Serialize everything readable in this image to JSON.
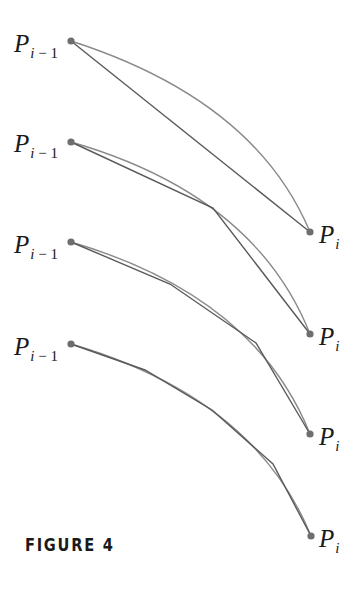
{
  "caption": "FIGURE 4",
  "colors": {
    "curve": "#8a8a8a",
    "polygon": "#5a5a5a",
    "point": "#6e6e6e",
    "text": "#1a1a1a"
  },
  "labels": {
    "start": {
      "base": "P",
      "sub_var": "i",
      "sub_rest": " − 1"
    },
    "end": {
      "base": "P",
      "sub_var": "i"
    }
  },
  "panels": [
    {
      "start_label_pos": [
        14,
        31
      ],
      "end_label_pos": [
        319,
        222
      ],
      "curve": "M71,41 Q255,100 310,232",
      "polygon": [
        [
          71,
          41
        ],
        [
          310,
          232
        ]
      ]
    },
    {
      "start_label_pos": [
        14,
        131
      ],
      "end_label_pos": [
        319,
        324
      ],
      "curve": "M71,142 Q255,195 310,334",
      "polygon": [
        [
          71,
          142
        ],
        [
          213,
          208
        ],
        [
          310,
          334
        ]
      ]
    },
    {
      "start_label_pos": [
        14,
        232
      ],
      "end_label_pos": [
        319,
        424
      ],
      "curve": "M71,242 Q255,296 310,434",
      "polygon": [
        [
          71,
          242
        ],
        [
          170,
          284
        ],
        [
          256,
          343
        ],
        [
          310,
          434
        ]
      ]
    },
    {
      "start_label_pos": [
        14,
        334
      ],
      "end_label_pos": [
        319,
        526
      ],
      "curve": "M71,344 Q255,398 311,536",
      "polygon": [
        [
          71,
          344
        ],
        [
          145,
          370
        ],
        [
          212,
          410
        ],
        [
          273,
          464
        ],
        [
          311,
          536
        ]
      ]
    }
  ]
}
